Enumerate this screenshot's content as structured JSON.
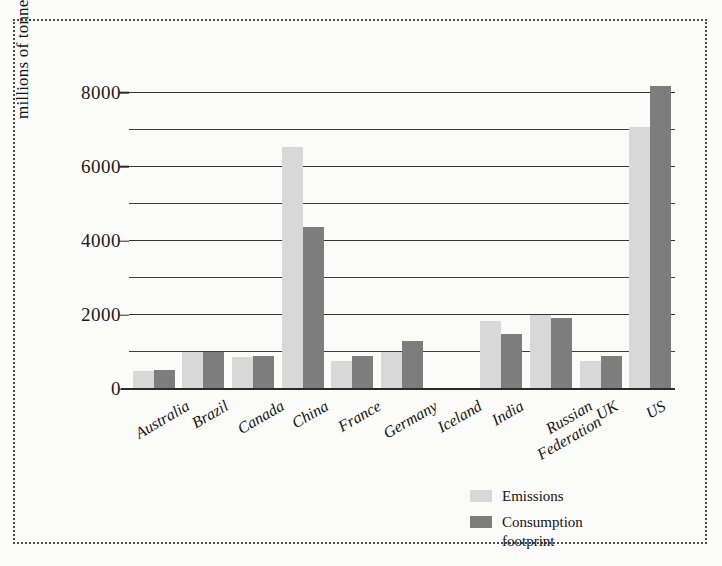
{
  "figure": {
    "background_color": "#fbfbfa",
    "border_style": "dotted",
    "border_color": "#4a4a4a"
  },
  "chart_data": {
    "type": "bar",
    "title": "",
    "xlabel": "",
    "ylabel": "millions of tonnes CO",
    "ylabel_sub": "2",
    "ylabel_suffix": "e",
    "ylim": [
      0,
      8400
    ],
    "ytick_values": [
      8000,
      6000,
      4000,
      2000,
      0
    ],
    "ytick_labels": [
      "8000",
      "6000",
      "4000",
      "2000",
      "0"
    ],
    "gridlines": [
      8000,
      7000,
      6000,
      5000,
      4000,
      3000,
      2000,
      1000
    ],
    "grid": true,
    "legend_position": "bottom-right",
    "categories": [
      "Australia",
      "Brazil",
      "Canada",
      "China",
      "France",
      "Germany",
      "Iceland",
      "India",
      "Russian Federation",
      "UK",
      "US"
    ],
    "category_lines": [
      [
        "Australia"
      ],
      [
        "Brazil"
      ],
      [
        "Canada"
      ],
      [
        "China"
      ],
      [
        "France"
      ],
      [
        "Germany"
      ],
      [
        "Iceland"
      ],
      [
        "India"
      ],
      [
        "Russian",
        "Federation"
      ],
      [
        "UK"
      ],
      [
        "US"
      ]
    ],
    "series": [
      {
        "name": "Emissions",
        "color": "#d8d8d8",
        "values": [
          500,
          1000,
          860,
          6550,
          750,
          1000,
          5,
          1830,
          2000,
          760,
          7080
        ]
      },
      {
        "name": "Consumption footprint",
        "color": "#7d7d7d",
        "values": [
          520,
          1010,
          890,
          4380,
          880,
          1300,
          8,
          1480,
          1930,
          880,
          8180
        ]
      }
    ]
  },
  "legend": {
    "items": [
      {
        "label": "Emissions",
        "label_lines": [
          "Emissions"
        ],
        "color": "#d8d8d8"
      },
      {
        "label": "Consumption footprint",
        "label_lines": [
          "Consumption",
          "footprint"
        ],
        "color": "#7d7d7d"
      }
    ]
  }
}
